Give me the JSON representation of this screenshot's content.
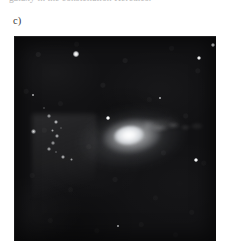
{
  "page": {
    "background_color": "#ffffff",
    "width": 229,
    "height": 241
  },
  "caption": {
    "cut_off_line": "galaxy in the constellation Hercules.",
    "note": "partially cropped line of body text at the very top edge"
  },
  "figure": {
    "panel_label": "c)",
    "panel": {
      "name": "astronomical-image",
      "background_color": "#121214",
      "x": 14,
      "y": 36,
      "width": 202,
      "height": 205,
      "caption_alt": "Deep optical image of an interacting elliptical galaxy with a bright nucleus, a chain of luminous knots to the lower left and a faint tidal plume extending to the right."
    },
    "objects": {
      "galaxy": {
        "name": "elliptical-galaxy",
        "center_x": 122,
        "center_y": 134,
        "core_color": "#ffffff",
        "halo_color": "#c8cbd0",
        "position_angle_deg": -7
      },
      "plume": {
        "name": "tidal-plume",
        "side": "right",
        "center_x": 165,
        "center_y": 125
      },
      "knots": [
        {
          "name": "knot",
          "x": 33,
          "y": 131,
          "size": 5.0,
          "brightness": 0.95
        },
        {
          "name": "knot",
          "x": 49,
          "y": 116,
          "size": 3.4,
          "brightness": 0.7
        },
        {
          "name": "knot",
          "x": 56,
          "y": 122,
          "size": 4.2,
          "brightness": 0.88
        },
        {
          "name": "knot",
          "x": 52,
          "y": 130,
          "size": 3.0,
          "brightness": 0.62
        },
        {
          "name": "knot",
          "x": 57,
          "y": 136,
          "size": 3.8,
          "brightness": 0.8
        },
        {
          "name": "knot",
          "x": 53,
          "y": 143,
          "size": 3.2,
          "brightness": 0.66
        },
        {
          "name": "knot",
          "x": 49,
          "y": 149,
          "size": 3.6,
          "brightness": 0.74
        },
        {
          "name": "knot",
          "x": 56,
          "y": 152,
          "size": 2.8,
          "brightness": 0.58
        },
        {
          "name": "knot",
          "x": 63,
          "y": 157,
          "size": 4.0,
          "brightness": 0.82
        },
        {
          "name": "knot",
          "x": 71,
          "y": 159,
          "size": 3.0,
          "brightness": 0.6
        },
        {
          "name": "knot",
          "x": 44,
          "y": 108,
          "size": 2.6,
          "brightness": 0.5
        },
        {
          "name": "knot",
          "x": 61,
          "y": 128,
          "size": 2.4,
          "brightness": 0.46
        }
      ],
      "stars": [
        {
          "name": "star",
          "x": 76,
          "y": 54,
          "size": 5.4
        },
        {
          "name": "star",
          "x": 199,
          "y": 58,
          "size": 4.6
        },
        {
          "name": "star",
          "x": 213,
          "y": 45,
          "size": 4.0
        },
        {
          "name": "star",
          "x": 196,
          "y": 160,
          "size": 3.4
        },
        {
          "name": "star",
          "x": 108,
          "y": 118,
          "size": 3.2
        },
        {
          "name": "star",
          "x": 160,
          "y": 98,
          "size": 2.6
        },
        {
          "name": "star",
          "x": 33,
          "y": 95,
          "size": 2.4
        },
        {
          "name": "star",
          "x": 118,
          "y": 226,
          "size": 2.6
        }
      ]
    }
  }
}
